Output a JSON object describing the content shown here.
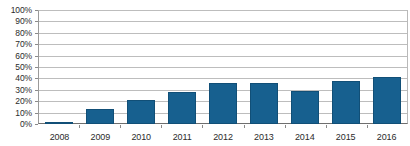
{
  "chart_data": {
    "type": "bar",
    "title": "",
    "subtitle": "",
    "xlabel": "",
    "ylabel": "",
    "categories": [
      "2008",
      "2009",
      "2010",
      "2011",
      "2012",
      "2013",
      "2014",
      "2015",
      "2016"
    ],
    "values": [
      2,
      13,
      21,
      28,
      36,
      36,
      29,
      38,
      41
    ],
    "value_suffix": "%",
    "ylim": [
      0,
      100
    ],
    "ytick_values": [
      0,
      10,
      20,
      30,
      40,
      50,
      60,
      70,
      80,
      90,
      100
    ],
    "ytick_labels": [
      "0%",
      "10%",
      "20%",
      "30%",
      "40%",
      "50%",
      "60%",
      "70%",
      "80%",
      "90%",
      "100%"
    ],
    "grid": true,
    "grid_axis": "y",
    "legend": false,
    "legend_position": "none",
    "series": [
      {
        "name": "",
        "values": [
          2,
          13,
          21,
          28,
          36,
          36,
          29,
          38,
          41
        ]
      }
    ],
    "colors": {
      "bar_fill": "#17608F",
      "bar_stroke": "#114F77",
      "gridline": "#BDBDBD",
      "axis": "#6E6E6E",
      "text": "#2B2B2B",
      "background": "#FFFFFF"
    }
  }
}
